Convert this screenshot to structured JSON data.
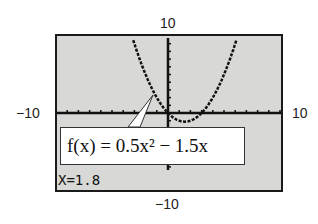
{
  "window": {
    "ymax_label": "10",
    "ymin_label": "−10",
    "xmin_label": "−10",
    "xmax_label": "10"
  },
  "callout": {
    "function_label": "f(x) = 0.5x² − 1.5x"
  },
  "trace": {
    "readout": "X=1.8"
  },
  "chart_data": {
    "type": "line",
    "title": "",
    "series": [
      {
        "name": "f(x) = 0.5x^2 - 1.5x",
        "expression": "0.5*x^2-1.5*x",
        "x": [
          -3,
          -2,
          -1,
          0,
          1,
          1.5,
          2,
          3,
          4,
          5,
          6
        ],
        "values": [
          9,
          5,
          2,
          0,
          -1,
          -1.125,
          -1,
          0,
          2,
          5,
          9
        ]
      }
    ],
    "xlabel": "",
    "ylabel": "",
    "xlim": [
      -10,
      10
    ],
    "ylim": [
      -10,
      10
    ],
    "xtick_step": 1,
    "ytick_step": 1,
    "grid": false,
    "annotations": [
      "f(x) = 0.5x² − 1.5x",
      "X=1.8"
    ]
  }
}
